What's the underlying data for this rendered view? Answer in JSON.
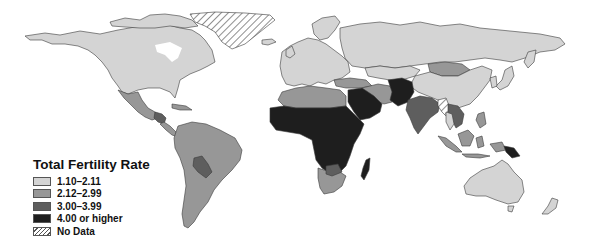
{
  "map": {
    "title": "Total Fertility Rate",
    "projection": "world",
    "legend": {
      "title": "Total Fertility Rate",
      "items": [
        {
          "label": "1.10–2.11",
          "color": "#d4d4d4",
          "pattern": "solid"
        },
        {
          "label": "2.12–2.99",
          "color": "#979797",
          "pattern": "solid"
        },
        {
          "label": "3.00–3.99",
          "color": "#5e5e5e",
          "pattern": "solid"
        },
        {
          "label": "4.00 or higher",
          "color": "#1e1e1e",
          "pattern": "solid"
        },
        {
          "label": "No Data",
          "color": "#ffffff",
          "pattern": "hatched"
        }
      ]
    },
    "regions": [
      {
        "name": "North America (USA, Canada)",
        "category": "1.10–2.11"
      },
      {
        "name": "Greenland",
        "category": "No Data"
      },
      {
        "name": "Mexico",
        "category": "2.12–2.99"
      },
      {
        "name": "Central America (Guatemala, Honduras)",
        "category": "3.00–3.99"
      },
      {
        "name": "South America",
        "category": "2.12–2.99"
      },
      {
        "name": "Bolivia / Paraguay",
        "category": "3.00–3.99"
      },
      {
        "name": "Europe",
        "category": "1.10–2.11"
      },
      {
        "name": "Russia",
        "category": "1.10–2.11"
      },
      {
        "name": "China",
        "category": "1.10–2.11"
      },
      {
        "name": "Mongolia",
        "category": "2.12–2.99"
      },
      {
        "name": "North Africa (Algeria, Libya, Egypt)",
        "category": "2.12–2.99"
      },
      {
        "name": "Sub-Saharan Africa",
        "category": "4.00 or higher"
      },
      {
        "name": "Southern Africa",
        "category": "2.12–2.99"
      },
      {
        "name": "Arabian Peninsula",
        "category": "4.00 or higher"
      },
      {
        "name": "Iran / Central Asia",
        "category": "2.12–2.99"
      },
      {
        "name": "Pakistan / Afghanistan",
        "category": "4.00 or higher"
      },
      {
        "name": "India",
        "category": "3.00–3.99"
      },
      {
        "name": "Myanmar",
        "category": "No Data"
      },
      {
        "name": "Southeast Asia (Laos, Cambodia)",
        "category": "3.00–3.99"
      },
      {
        "name": "Indonesia / Philippines",
        "category": "2.12–2.99"
      },
      {
        "name": "Papua New Guinea",
        "category": "4.00 or higher"
      },
      {
        "name": "Australia",
        "category": "1.10–2.11"
      },
      {
        "name": "New Zealand",
        "category": "1.10–2.11"
      },
      {
        "name": "Madagascar",
        "category": "4.00 or higher"
      }
    ]
  }
}
